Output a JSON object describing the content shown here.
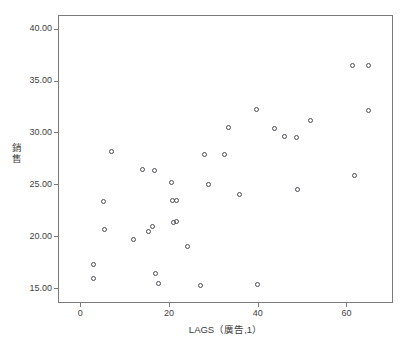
{
  "chart_data": {
    "type": "scatter",
    "title": "",
    "xlabel": "LAGS（廣告,1）",
    "ylabel": "銷售",
    "xlim": [
      -5,
      70.5
    ],
    "ylim": [
      13.6,
      41.3
    ],
    "xticks": [
      0,
      20,
      40,
      60
    ],
    "xtick_labels": [
      "0",
      "20",
      "40",
      "60"
    ],
    "yticks": [
      15,
      20,
      25,
      30,
      35,
      40
    ],
    "ytick_labels": [
      "15.00",
      "20.00",
      "25.00",
      "30.00",
      "35.00",
      "40.00"
    ],
    "grid": false,
    "legend": null,
    "marker": "open-circle",
    "marker_color": "#4a4a52",
    "frame_color": "#7a7a7a",
    "background": "#ffffff",
    "points": [
      {
        "x": 3.0,
        "y": 17.3
      },
      {
        "x": 3.0,
        "y": 16.0
      },
      {
        "x": 5.2,
        "y": 23.4
      },
      {
        "x": 5.4,
        "y": 20.7
      },
      {
        "x": 7.0,
        "y": 28.2
      },
      {
        "x": 12.0,
        "y": 19.7
      },
      {
        "x": 14.0,
        "y": 26.4
      },
      {
        "x": 15.3,
        "y": 20.5
      },
      {
        "x": 16.4,
        "y": 21.0
      },
      {
        "x": 16.8,
        "y": 26.3
      },
      {
        "x": 17.0,
        "y": 16.4
      },
      {
        "x": 17.6,
        "y": 15.5
      },
      {
        "x": 20.6,
        "y": 25.2
      },
      {
        "x": 20.7,
        "y": 23.5
      },
      {
        "x": 21.6,
        "y": 23.5
      },
      {
        "x": 21.0,
        "y": 21.3
      },
      {
        "x": 21.8,
        "y": 21.4
      },
      {
        "x": 24.1,
        "y": 19.0
      },
      {
        "x": 27.2,
        "y": 15.3
      },
      {
        "x": 28.0,
        "y": 27.9
      },
      {
        "x": 29.0,
        "y": 25.0
      },
      {
        "x": 32.6,
        "y": 27.9
      },
      {
        "x": 33.5,
        "y": 30.5
      },
      {
        "x": 35.8,
        "y": 24.0
      },
      {
        "x": 39.8,
        "y": 32.2
      },
      {
        "x": 39.9,
        "y": 15.4
      },
      {
        "x": 43.9,
        "y": 30.4
      },
      {
        "x": 46.0,
        "y": 29.6
      },
      {
        "x": 48.7,
        "y": 29.5
      },
      {
        "x": 49.0,
        "y": 24.5
      },
      {
        "x": 52.0,
        "y": 31.2
      },
      {
        "x": 61.4,
        "y": 36.4
      },
      {
        "x": 61.8,
        "y": 25.9
      },
      {
        "x": 65.0,
        "y": 36.4
      },
      {
        "x": 65.0,
        "y": 32.1
      }
    ]
  }
}
